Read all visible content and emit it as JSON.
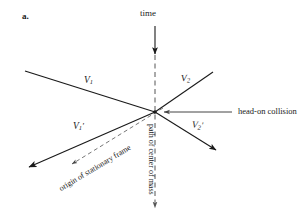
{
  "figure": {
    "panel_letter": "a.",
    "background_color": "#ffffff",
    "line_color": "#1a1a1a",
    "dash_color": "#555555",
    "axes": {
      "time_axis_label": "time",
      "center_of_mass_label": "path of center of mass"
    },
    "annotations": {
      "head_on_collision": "head-on collision",
      "origin_of_stationary_frame": "origin of stationary frame"
    },
    "vectors": [
      {
        "name": "v1-incoming",
        "symbol": "V",
        "subscript": "1",
        "prime": "",
        "description": "incoming velocity of particle 1 from upper left"
      },
      {
        "name": "v2-incoming",
        "symbol": "V",
        "subscript": "2",
        "prime": "",
        "description": "incoming velocity of particle 2 from upper right"
      },
      {
        "name": "v1-outgoing",
        "symbol": "V",
        "subscript": "1",
        "prime": "'",
        "description": "outgoing velocity of particle 1 toward lower left"
      },
      {
        "name": "v2-outgoing",
        "symbol": "V",
        "subscript": "2",
        "prime": "'",
        "description": "outgoing velocity of particle 2 toward lower right"
      }
    ]
  }
}
